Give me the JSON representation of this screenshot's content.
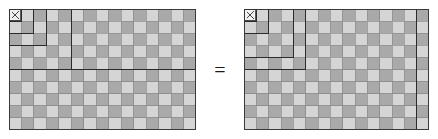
{
  "figure": {
    "relation_symbol": "=",
    "relation_symbol_name": "equals-sign",
    "colors": {
      "light_cell": "#d5d5d5",
      "dark_cell": "#a9a9a9",
      "cell_gridline": "#8d8d8d",
      "outline": "#3a3a3a",
      "region_outline": "#2b2b2b",
      "background": "#ffffff",
      "marker": "#333333"
    },
    "grid": {
      "columns": 15,
      "rows": 10,
      "cell_size": 12.4,
      "total_cells": 150
    },
    "corner_marker": {
      "glyph": "x",
      "label": "x",
      "cell_col": 0,
      "cell_row": 0
    }
  },
  "left_panel": {
    "label": "Sum of cubes as nested gnomons",
    "decomposition_type": "gnomon",
    "regions": [
      {
        "name": "gnomon-1",
        "size": 1,
        "cells": 1,
        "x": 0,
        "y": 0,
        "w": 1,
        "h": 1
      },
      {
        "name": "gnomon-2",
        "size": 2,
        "cells": 3,
        "x": 0,
        "y": 0,
        "w": 2,
        "h": 2
      },
      {
        "name": "gnomon-3",
        "size": 3,
        "cells": 5,
        "x": 0,
        "y": 0,
        "w": 3,
        "h": 3
      },
      {
        "name": "gnomon-4",
        "size": 5,
        "cells": 9,
        "x": 0,
        "y": 0,
        "w": 5,
        "h": 5
      },
      {
        "name": "band-row-5",
        "size": 15,
        "cells": 75,
        "x": 0,
        "y": 0,
        "w": 15,
        "h": 5
      }
    ]
  },
  "right_panel": {
    "label": "Square of triangular number as nested squares",
    "decomposition_type": "nested-squares",
    "regions": [
      {
        "name": "square-1",
        "size": 1,
        "cells": 1,
        "x": 0,
        "y": 0,
        "w": 1,
        "h": 1
      },
      {
        "name": "square-2",
        "size": 2,
        "cells": 4,
        "x": 0,
        "y": 0,
        "w": 2,
        "h": 2
      },
      {
        "name": "square-3",
        "size": 4,
        "cells": 16,
        "x": 0,
        "y": 0,
        "w": 4,
        "h": 4
      },
      {
        "name": "square-4",
        "size": 5,
        "cells": 25,
        "x": 0,
        "y": 0,
        "w": 5,
        "h": 5
      },
      {
        "name": "square-5",
        "size": 14,
        "cells": 196,
        "x": 0,
        "y": 0,
        "w": 14,
        "h": 10
      }
    ]
  },
  "chart_data": {
    "type": "heatmap",
    "xlabel": "",
    "ylabel": "",
    "grid": true,
    "legend_position": "none",
    "panels": [
      {
        "name": "left",
        "columns": 15,
        "rows": 10,
        "pattern": "checkerboard",
        "overlay_lines": [
          {
            "type": "rect",
            "x": 0,
            "y": 0,
            "w": 1,
            "h": 1
          },
          {
            "type": "rect",
            "x": 0,
            "y": 0,
            "w": 2,
            "h": 2
          },
          {
            "type": "rect",
            "x": 0,
            "y": 0,
            "w": 3,
            "h": 3
          },
          {
            "type": "rect",
            "x": 0,
            "y": 0,
            "w": 5,
            "h": 5
          },
          {
            "type": "line",
            "x1": 0,
            "y1": 5,
            "x2": 15,
            "y2": 5
          }
        ]
      },
      {
        "name": "right",
        "columns": 15,
        "rows": 10,
        "pattern": "checkerboard",
        "overlay_lines": [
          {
            "type": "rect",
            "x": 0,
            "y": 0,
            "w": 1,
            "h": 1
          },
          {
            "type": "rect",
            "x": 0,
            "y": 0,
            "w": 2,
            "h": 2
          },
          {
            "type": "rect",
            "x": 0,
            "y": 0,
            "w": 4,
            "h": 4
          },
          {
            "type": "rect",
            "x": 0,
            "y": 0,
            "w": 5,
            "h": 5
          },
          {
            "type": "line",
            "x1": 14,
            "y1": 0,
            "x2": 14,
            "y2": 10
          }
        ]
      }
    ]
  }
}
